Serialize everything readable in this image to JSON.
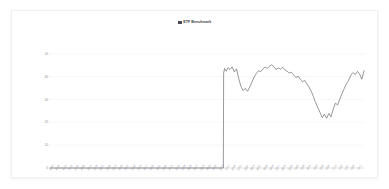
{
  "card": {
    "background": "#ffffff",
    "border_color": "#f0f0f0"
  },
  "chart_data": {
    "type": "line",
    "title": "ETF Benchmark",
    "title_swatch_color": "#4a4a52",
    "xlabel": "",
    "ylabel": "",
    "grid": true,
    "legend_position": "top-center",
    "line_color": "#5a5a62",
    "ylim": [
      0,
      60
    ],
    "yticks": [
      0,
      10,
      20,
      30,
      40,
      50
    ],
    "ytick_labels": [
      "0",
      "10",
      "20",
      "30",
      "40",
      "50"
    ],
    "xlim": [
      0,
      100
    ],
    "xticks": [
      0,
      2,
      4,
      6,
      8,
      10,
      12,
      14,
      16,
      18,
      20,
      22,
      24,
      26,
      28,
      30,
      32,
      34,
      36,
      38,
      40,
      42,
      44,
      46,
      48,
      50,
      52,
      54,
      56,
      58,
      60,
      62,
      64,
      66,
      68,
      70,
      72,
      74,
      76,
      78,
      80,
      82,
      84,
      86,
      88,
      90,
      92,
      94,
      96,
      98
    ],
    "xtick_labels": [
      "01/02",
      "01/09",
      "01/16",
      "01/23",
      "01/30",
      "02/06",
      "02/13",
      "02/20",
      "02/27",
      "03/06",
      "03/13",
      "03/20",
      "03/27",
      "04/03",
      "04/10",
      "04/17",
      "04/24",
      "05/01",
      "05/08",
      "05/15",
      "05/22",
      "05/29",
      "06/05",
      "06/12",
      "06/19",
      "06/26",
      "07/03",
      "07/10",
      "07/17",
      "07/24",
      "07/31",
      "08/07",
      "08/14",
      "08/21",
      "08/28",
      "09/04",
      "09/11",
      "09/18",
      "09/25",
      "10/02",
      "10/09",
      "10/16",
      "10/23",
      "10/30",
      "11/06",
      "11/13",
      "11/20",
      "11/27",
      "12/04",
      "12/11"
    ],
    "series": [
      {
        "name": "ETF Benchmark",
        "x": [
          0,
          1.2,
          2.4,
          3.6,
          4.8,
          6,
          7.2,
          8.4,
          9.6,
          10.8,
          12,
          13.2,
          14.4,
          15.6,
          16.8,
          18,
          19.2,
          20.4,
          21.6,
          22.8,
          24,
          25.2,
          26.4,
          27.6,
          28.8,
          30,
          31.2,
          32.4,
          33.6,
          34.8,
          36,
          37.2,
          38.4,
          39.6,
          40.8,
          42,
          43.2,
          44.4,
          45.6,
          46.8,
          48,
          49.2,
          50.4,
          51.6,
          52.8,
          54,
          55.2,
          55.3,
          55.6,
          56.1,
          56.7,
          57.3,
          58,
          58.7,
          59.4,
          60.1,
          60.8,
          61.5,
          62.2,
          62.9,
          63.6,
          64.3,
          65,
          65.7,
          66.4,
          67.1,
          67.8,
          68.5,
          69.2,
          69.9,
          70.6,
          71.3,
          72,
          72.7,
          73.4,
          74.1,
          74.8,
          75.5,
          76.2,
          76.9,
          77.6,
          78.3,
          79,
          79.7,
          80.4,
          81.1,
          81.8,
          82.5,
          83.2,
          83.9,
          84.6,
          85.3,
          86,
          86.7,
          87.4,
          88.1,
          88.8,
          89.5,
          90.2,
          90.9,
          91.6,
          92.3,
          93,
          93.7,
          94.4,
          95.1,
          95.8,
          96.5,
          97.2,
          97.9,
          98.6,
          99.3,
          100
        ],
        "y": [
          0,
          0,
          0,
          0,
          0,
          0,
          0,
          0,
          0,
          0,
          0,
          0,
          0,
          0,
          0,
          0,
          0,
          0,
          0,
          0,
          0,
          0,
          0,
          0,
          0,
          0,
          0,
          0,
          0,
          0,
          0,
          0,
          0,
          0,
          0,
          0,
          0,
          0,
          0,
          0,
          0,
          0,
          0,
          0,
          0,
          0,
          0,
          41.5,
          43.6,
          42.4,
          43.9,
          43.2,
          44.3,
          42.1,
          43.4,
          39.2,
          35.8,
          33.9,
          34.9,
          33.6,
          35.4,
          37.6,
          39.8,
          41.4,
          42.6,
          42.2,
          43.4,
          44.2,
          43.6,
          44.6,
          45.2,
          44.3,
          43.1,
          43.9,
          43.3,
          44.1,
          43.0,
          42.4,
          41.6,
          41.9,
          40.8,
          39.6,
          40.2,
          38.9,
          37.8,
          38.4,
          36.9,
          35.4,
          33.6,
          31.2,
          28.6,
          26.4,
          24.3,
          22.1,
          23.6,
          21.8,
          23.9,
          22.4,
          25.8,
          28.4,
          27.6,
          30.2,
          32.6,
          34.8,
          36.9,
          38.4,
          40.6,
          41.8,
          40.9,
          42.3,
          41.1,
          38.9,
          42.6
        ]
      }
    ]
  }
}
